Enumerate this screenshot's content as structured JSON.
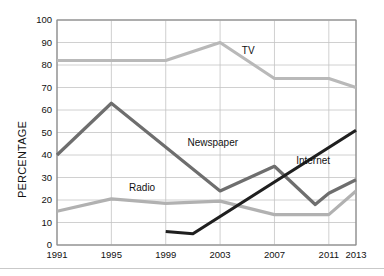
{
  "chart_data": {
    "type": "line",
    "title": "",
    "xlabel": "",
    "ylabel": "PERCENTAGE",
    "xlim": [
      1991,
      2013
    ],
    "ylim": [
      0,
      100
    ],
    "grid": true,
    "legend_position": "inline-labels",
    "xticks": [
      "1991",
      "1995",
      "1999",
      "2003",
      "2007",
      "2011",
      "2013"
    ],
    "yticks": [
      "0",
      "10",
      "20",
      "30",
      "40",
      "50",
      "60",
      "70",
      "80",
      "90",
      "100"
    ],
    "series": [
      {
        "name": "TV",
        "color": "#b9b9b9",
        "label_x": 2004.6,
        "label_y": 86,
        "x": [
          1991,
          1999,
          2003,
          2007,
          2011,
          2013
        ],
        "values": [
          82,
          82,
          90,
          74,
          74,
          70
        ]
      },
      {
        "name": "Newspaper",
        "color": "#6e6e6e",
        "label_x": 2000.6,
        "label_y": 45,
        "x": [
          1991,
          1995,
          2003,
          2007,
          2010,
          2011,
          2013
        ],
        "values": [
          40,
          63,
          24,
          35,
          18,
          23,
          29
        ]
      },
      {
        "name": "Radio",
        "color": "#b1b1b1",
        "label_x": 1996.3,
        "label_y": 25,
        "x": [
          1991,
          1995,
          1999,
          2003,
          2007,
          2011,
          2013
        ],
        "values": [
          15,
          20.5,
          18.5,
          19.5,
          13.5,
          13.5,
          24
        ]
      },
      {
        "name": "Internet",
        "color": "#1f1f1f",
        "label_x": 2008.6,
        "label_y": 37,
        "x": [
          1999,
          2001,
          2013
        ],
        "values": [
          6,
          5,
          51
        ]
      }
    ]
  }
}
